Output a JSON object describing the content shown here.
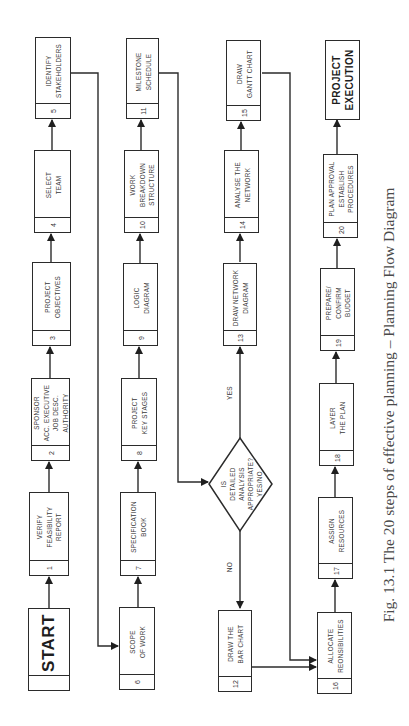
{
  "figure": {
    "caption": "Fig. 13.1   The 20 steps of effective planning – Planning Flow Diagram",
    "orientation": "rotated 90° counter-clockwise (flow runs bottom-to-top in each column)"
  },
  "nodes": {
    "start": {
      "label": "START"
    },
    "s1": {
      "num": "1",
      "label": "VERIFY\nFEASIBILITY\nREPORT"
    },
    "s2": {
      "num": "2",
      "label": "SPONSOR\nACC. EXECUTIVE\nJOB DESC.\nAUTHORITY"
    },
    "s3": {
      "num": "3",
      "label": "PROJECT\nOBJECTIVES"
    },
    "s4": {
      "num": "4",
      "label": "SELECT\nTEAM"
    },
    "s5": {
      "num": "5",
      "label": "IDENTIFY\nSTAKEHOLDERS"
    },
    "s6": {
      "num": "6",
      "label": "SCOPE\nOF WORK"
    },
    "s7": {
      "num": "7",
      "label": "SPECIFICATION\nBOOK"
    },
    "s8": {
      "num": "8",
      "label": "PROJECT\nKEY STAGES"
    },
    "s9": {
      "num": "9",
      "label": "LOGIC\nDIAGRAM"
    },
    "s10": {
      "num": "10",
      "label": "WORK\nBREAKDOWN\nSTRUCTURE"
    },
    "s11": {
      "num": "11",
      "label": "MILESTONE\nSCHEDULE"
    },
    "decision": {
      "label": "IS\nDETAILED\nANALYSIS\nAPPROPRIATE?\nYES/NO",
      "yes": "YES",
      "no": "NO"
    },
    "s12": {
      "num": "12",
      "label": "DRAW THE\nBAR CHART"
    },
    "s13": {
      "num": "13",
      "label": "DRAW NETWORK\nDIAGRAM"
    },
    "s14": {
      "num": "14",
      "label": "ANALYSE THE\nNETWORK"
    },
    "s15": {
      "num": "15",
      "label": "DRAW\nGANTT CHART"
    },
    "s16": {
      "num": "16",
      "label": "ALLOCATE\nREONSIBILITIES"
    },
    "s17": {
      "num": "17",
      "label": "ASSIGN\nRESOURCES"
    },
    "s18": {
      "num": "18",
      "label": "LAYER\nTHE PLAN"
    },
    "s19": {
      "num": "19",
      "label": "PREPARE/\nCONFIRM\nBUDGET"
    },
    "s20": {
      "num": "20",
      "label": "PLAN APPROVAL\nESTABLISH\nPROCEDURES"
    },
    "end": {
      "label": "PROJECT\nEXECUTION"
    }
  },
  "edges": [
    [
      "start",
      "s1"
    ],
    [
      "s1",
      "s2"
    ],
    [
      "s2",
      "s3"
    ],
    [
      "s3",
      "s4"
    ],
    [
      "s4",
      "s5"
    ],
    [
      "s5",
      "s6"
    ],
    [
      "s6",
      "s7"
    ],
    [
      "s7",
      "s8"
    ],
    [
      "s8",
      "s9"
    ],
    [
      "s9",
      "s10"
    ],
    [
      "s10",
      "s11"
    ],
    [
      "s11",
      "decision"
    ],
    [
      "decision",
      "s13",
      "YES"
    ],
    [
      "decision",
      "s12",
      "NO"
    ],
    [
      "s13",
      "s14"
    ],
    [
      "s14",
      "s15"
    ],
    [
      "s15",
      "s16"
    ],
    [
      "s12",
      "s16"
    ],
    [
      "s16",
      "s17"
    ],
    [
      "s17",
      "s18"
    ],
    [
      "s18",
      "s19"
    ],
    [
      "s19",
      "s20"
    ],
    [
      "s20",
      "end"
    ]
  ],
  "colors": {
    "line": "#2b2b2b",
    "text": "#3a3a3a",
    "caption": "#4a4a4a",
    "background": "#ffffff"
  }
}
